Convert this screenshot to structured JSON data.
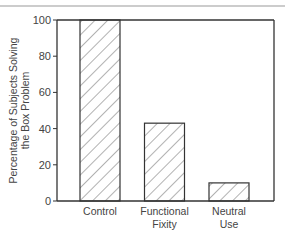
{
  "chart_data": {
    "type": "bar",
    "title": "",
    "xlabel": "",
    "ylabel": "Percentage of Subjects Solving the Box Problem",
    "ylabel_lines": [
      "Percentage of Subjects Solving",
      "the Box Problem"
    ],
    "categories": [
      "Control",
      "Functional Fixity",
      "Neutral Use"
    ],
    "category_lines": [
      [
        "Control"
      ],
      [
        "Functional",
        "Fixity"
      ],
      [
        "Neutral",
        "Use"
      ]
    ],
    "values": [
      100,
      43,
      10
    ],
    "ylim": [
      0,
      100
    ],
    "yticks": [
      0,
      20,
      40,
      60,
      80,
      100
    ],
    "grid": false,
    "legend": null,
    "bar_fill": "diagonal-hatch",
    "colors": {
      "line": "#333333",
      "hatch": "#555555",
      "background": "#ffffff"
    }
  }
}
